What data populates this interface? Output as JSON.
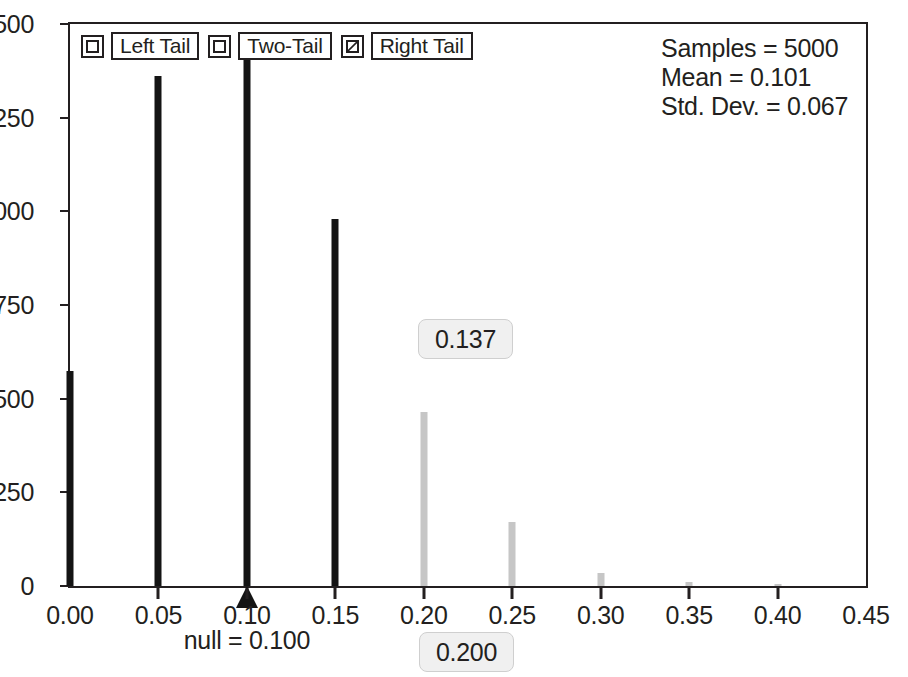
{
  "legend": {
    "items": [
      {
        "label": "Left Tail",
        "checked": false,
        "name": "legend-item-left-tail"
      },
      {
        "label": "Two-Tail",
        "checked": false,
        "name": "legend-item-two-tail"
      },
      {
        "label": "Right Tail",
        "checked": true,
        "name": "legend-item-right-tail"
      }
    ]
  },
  "stats": {
    "samples_line": "Samples = 5000",
    "mean_line": "Mean = 0.101",
    "std_dev_line": "Std. Dev. = 0.067",
    "samples": 5000,
    "mean": 0.101,
    "std_dev": 0.067
  },
  "annotations": {
    "tail_proportion": "0.137",
    "cutoff_value": "0.200",
    "null_label": "null = 0.100",
    "null_value": 0.1
  },
  "colors": {
    "body_bar": "#141414",
    "tail_bar": "#c6c6c6",
    "axis": "#231f20",
    "chip_background": "#f0f0f0",
    "chip_border": "#cfcfcf"
  },
  "chart_data": {
    "type": "bar",
    "title": "",
    "xlabel": "",
    "ylabel": "",
    "xlim": [
      0.0,
      0.45
    ],
    "ylim": [
      0,
      1500
    ],
    "grid": false,
    "legend_position": "top-left",
    "xticks": [
      0.0,
      0.05,
      0.1,
      0.15,
      0.2,
      0.25,
      0.3,
      0.35,
      0.4,
      0.45
    ],
    "xticklabels": [
      "0.00",
      "0.05",
      "0.10",
      "0.15",
      "0.20",
      "0.25",
      "0.30",
      "0.35",
      "0.40",
      "0.45"
    ],
    "yticks": [
      0,
      250,
      500,
      750,
      1000,
      1250,
      1500
    ],
    "yticklabels": [
      "0",
      "250",
      "500",
      "750",
      "1000",
      "1250",
      "1500"
    ],
    "bar_width": 0.007,
    "bars": [
      {
        "x": 0.0,
        "value": 575,
        "group": "body"
      },
      {
        "x": 0.05,
        "value": 1360,
        "group": "body"
      },
      {
        "x": 0.1,
        "value": 1405,
        "group": "body"
      },
      {
        "x": 0.15,
        "value": 980,
        "group": "body"
      },
      {
        "x": 0.2,
        "value": 465,
        "group": "tail"
      },
      {
        "x": 0.25,
        "value": 170,
        "group": "tail"
      },
      {
        "x": 0.3,
        "value": 35,
        "group": "tail"
      },
      {
        "x": 0.35,
        "value": 12,
        "group": "tail"
      },
      {
        "x": 0.4,
        "value": 3,
        "group": "tail"
      }
    ]
  }
}
